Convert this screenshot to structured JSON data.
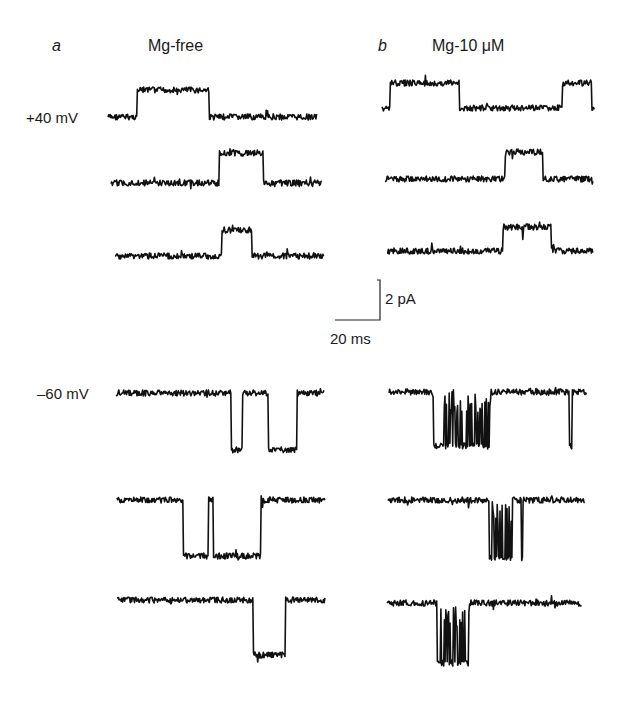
{
  "figure": {
    "panels": [
      {
        "letter": "a",
        "title": "Mg-free"
      },
      {
        "letter": "b",
        "title": "Mg-10 μM"
      }
    ],
    "voltage_labels": {
      "positive": "+40 mV",
      "negative": "–60 mV"
    },
    "scale_bar": {
      "current_label": "2 pA",
      "time_label": "20 ms"
    }
  },
  "chart_data": {
    "type": "line",
    "xlabel": "Time",
    "ylabel": "Current",
    "scale_bar": {
      "current_pA": 2,
      "time_ms": 20
    },
    "legend": [],
    "grid": false,
    "conditions": [
      "Mg-free",
      "Mg-10 μM"
    ],
    "voltages_mV": [
      40,
      -60
    ],
    "traces": [
      {
        "panel": "a",
        "condition": "Mg-free",
        "voltage_mV": 40,
        "row": 1,
        "x0": 108,
        "x1": 317,
        "baseline_y": 117,
        "open_y": 90,
        "noise": 3,
        "events": [
          [
            137,
            209,
            0
          ]
        ]
      },
      {
        "panel": "a",
        "condition": "Mg-free",
        "voltage_mV": 40,
        "row": 2,
        "x0": 111,
        "x1": 322,
        "baseline_y": 183,
        "open_y": 153,
        "noise": 3,
        "events": [
          [
            219,
            263,
            0
          ]
        ]
      },
      {
        "panel": "a",
        "condition": "Mg-free",
        "voltage_mV": 40,
        "row": 3,
        "x0": 115,
        "x1": 324,
        "baseline_y": 256,
        "open_y": 230,
        "noise": 3,
        "events": [
          [
            222,
            252,
            0
          ]
        ]
      },
      {
        "panel": "b",
        "condition": "Mg-10 μM",
        "voltage_mV": 40,
        "row": 1,
        "x0": 382,
        "x1": 595,
        "baseline_y": 108,
        "open_y": 83,
        "noise": 3,
        "events": [
          [
            390,
            459,
            0
          ],
          [
            562,
            592,
            0
          ]
        ]
      },
      {
        "panel": "b",
        "condition": "Mg-10 μM",
        "voltage_mV": 40,
        "row": 2,
        "x0": 385,
        "x1": 593,
        "baseline_y": 179,
        "open_y": 152,
        "noise": 3,
        "events": [
          [
            505,
            543,
            1
          ]
        ]
      },
      {
        "panel": "b",
        "condition": "Mg-10 μM",
        "voltage_mV": 40,
        "row": 3,
        "x0": 387,
        "x1": 593,
        "baseline_y": 251,
        "open_y": 227,
        "noise": 3,
        "events": [
          [
            503,
            551,
            1
          ]
        ]
      },
      {
        "panel": "a",
        "condition": "Mg-free",
        "voltage_mV": -60,
        "row": 4,
        "x0": 116,
        "x1": 324,
        "baseline_y": 393,
        "open_y": 450,
        "noise": 3,
        "events": [
          [
            231,
            242,
            0
          ],
          [
            268,
            297,
            0
          ]
        ]
      },
      {
        "panel": "a",
        "condition": "Mg-free",
        "voltage_mV": -60,
        "row": 5,
        "x0": 117,
        "x1": 325,
        "baseline_y": 500,
        "open_y": 556,
        "noise": 3,
        "events": [
          [
            183,
            208,
            0
          ],
          [
            213,
            261,
            0
          ]
        ]
      },
      {
        "panel": "a",
        "condition": "Mg-free",
        "voltage_mV": -60,
        "row": 6,
        "x0": 117,
        "x1": 325,
        "baseline_y": 600,
        "open_y": 655,
        "noise": 3,
        "events": [
          [
            253,
            285,
            0
          ]
        ]
      },
      {
        "panel": "b",
        "condition": "Mg-10 μM",
        "voltage_mV": -60,
        "row": 4,
        "x0": 389,
        "x1": 587,
        "baseline_y": 392,
        "open_y": 446,
        "noise": 3,
        "events": [
          [
            433,
            491,
            2
          ],
          [
            569,
            572,
            0
          ]
        ]
      },
      {
        "panel": "b",
        "condition": "Mg-10 μM",
        "voltage_mV": -60,
        "row": 5,
        "x0": 388,
        "x1": 585,
        "baseline_y": 500,
        "open_y": 558,
        "noise": 3,
        "events": [
          [
            489,
            512,
            2
          ],
          [
            521,
            523,
            0
          ]
        ]
      },
      {
        "panel": "b",
        "condition": "Mg-10 μM",
        "voltage_mV": -60,
        "row": 6,
        "x0": 387,
        "x1": 582,
        "baseline_y": 603,
        "open_y": 663,
        "noise": 3,
        "events": [
          [
            437,
            469,
            2
          ]
        ]
      }
    ]
  }
}
